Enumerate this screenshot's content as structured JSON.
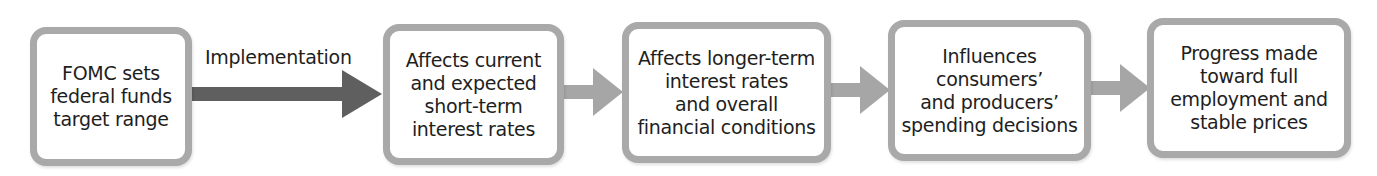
{
  "diagram": {
    "type": "flowchart",
    "direction": "left-to-right",
    "nodes": [
      {
        "id": "fomc",
        "label": "FOMC sets\nfederal funds\ntarget range"
      },
      {
        "id": "short_term",
        "label": "Affects current\nand expected\nshort-term\ninterest rates"
      },
      {
        "id": "long_term",
        "label": "Affects longer-term\ninterest rates\nand overall\nfinancial conditions"
      },
      {
        "id": "spending",
        "label": "Influences\nconsumers’\nand producers’\nspending decisions"
      },
      {
        "id": "goals",
        "label": "Progress made\ntoward full\nemployment and\nstable prices"
      }
    ],
    "edges": [
      {
        "from": "fomc",
        "to": "short_term",
        "label": "Implementation",
        "style": "dark"
      },
      {
        "from": "short_term",
        "to": "long_term",
        "label": "",
        "style": "light"
      },
      {
        "from": "long_term",
        "to": "spending",
        "label": "",
        "style": "light"
      },
      {
        "from": "spending",
        "to": "goals",
        "label": "",
        "style": "light"
      }
    ],
    "colors": {
      "box_border": "#a9a9a9",
      "dark_arrow": "#5f5f5f",
      "light_arrow": "#a6a6a6",
      "text": "#1e1e1e"
    }
  }
}
